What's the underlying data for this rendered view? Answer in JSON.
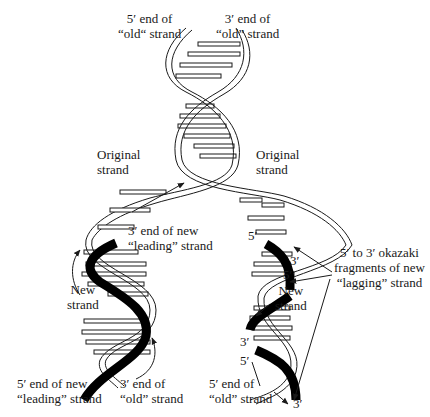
{
  "diagram": {
    "labels": {
      "top_left": {
        "line1": "5′ end of",
        "line2": "“old“ strand"
      },
      "top_right": {
        "line1": "3′ end of",
        "line2": "“old” strand"
      },
      "original_left": {
        "line1": "Original",
        "line2": "strand"
      },
      "original_right": {
        "line1": "Original",
        "line2": "strand"
      },
      "leading_end": {
        "line1": "3′ end of new",
        "line2": "“leading” strand"
      },
      "new_left": {
        "line1": "New",
        "line2": "strand"
      },
      "new_right": {
        "line1": "New",
        "line2": "strand"
      },
      "okazaki": {
        "line1": "5′ to 3′ okazaki",
        "line2": "fragments of new",
        "line3": "“lagging” strand"
      },
      "bottom_left_new": {
        "line1": "5′ end of new",
        "line2": "“leading” strand"
      },
      "bottom_left_old": {
        "line1": "3′ end of",
        "line2": "“old” strand"
      },
      "bottom_right_old": {
        "line1": "5′ end of",
        "line2": "“old” strand"
      }
    },
    "end_markers": {
      "r5_top": "5′",
      "r3_a": "3′",
      "r5_b": "5′",
      "r3_c": "3′",
      "r5_c": "5′",
      "r3_bottom": "3′"
    },
    "colors": {
      "ink": "#1a1a1a",
      "new_strand": "#000000",
      "background": "#ffffff"
    }
  }
}
